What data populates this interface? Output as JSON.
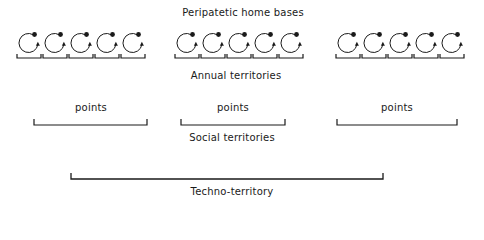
{
  "labels": {
    "home_bases": "Peripatetic home bases",
    "annual": "Annual territories",
    "social": "Social territories",
    "techno": "Techno-territory",
    "points": [
      "points",
      "points",
      "points"
    ]
  },
  "groups": [
    {
      "name": "left",
      "circle_x": [
        18,
        44,
        70,
        96,
        122
      ]
    },
    {
      "name": "middle",
      "circle_x": [
        176,
        202,
        228,
        254,
        280
      ]
    },
    {
      "name": "right",
      "circle_x": [
        337,
        363,
        389,
        415,
        441
      ]
    }
  ],
  "point_brackets": [
    [
      34,
      147
    ],
    [
      181,
      285
    ],
    [
      337,
      457
    ]
  ],
  "techno_bracket": [
    71,
    383
  ]
}
